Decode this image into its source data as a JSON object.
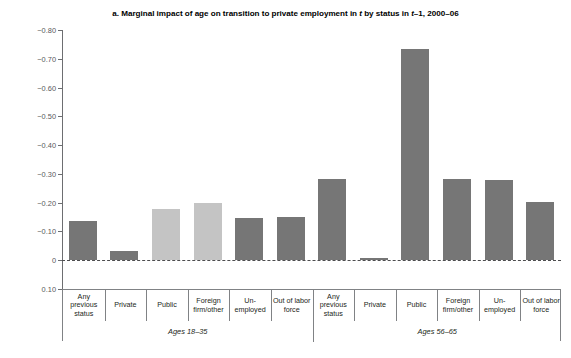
{
  "chart_data": {
    "type": "bar",
    "title": "a. Marginal impact of age on transition to private employment in t by status in t–1, 2000–06",
    "title_parts": {
      "p1": "a. Marginal impact of age on transition to private employment in ",
      "i1": "t",
      "p2": " by status in ",
      "i2": "t",
      "p3": "–1, 2000–06"
    },
    "xlabel": "",
    "ylabel": "Probabilities",
    "ylim": [
      0.1,
      -0.8
    ],
    "y_inverted": true,
    "yticks": [
      "−0.80",
      "−0.70",
      "−0.60",
      "−0.50",
      "−0.40",
      "−0.30",
      "−0.20",
      "−0.10",
      "0",
      "0.10"
    ],
    "ytick_values": [
      -0.8,
      -0.7,
      -0.6,
      -0.5,
      -0.4,
      -0.3,
      -0.2,
      -0.1,
      0,
      0.1
    ],
    "grid": false,
    "legend": "none",
    "zero_line": true,
    "groups": [
      {
        "name": "Ages 18–35",
        "categories": [
          "Any previous status",
          "Private",
          "Public",
          "Foreign firm/other",
          "Un-employed",
          "Out of labor force"
        ],
        "values": [
          -0.135,
          -0.032,
          -0.178,
          -0.2,
          -0.148,
          -0.15
        ],
        "shades": [
          "dark",
          "dark",
          "light",
          "light",
          "dark",
          "dark"
        ]
      },
      {
        "name": "Ages 56–65",
        "categories": [
          "Any previous status",
          "Private",
          "Public",
          "Foreign firm/other",
          "Un-employed",
          "Out of labor force"
        ],
        "values": [
          -0.282,
          -0.008,
          -0.733,
          -0.282,
          -0.278,
          -0.203
        ],
        "shades": [
          "dark",
          "dark",
          "dark",
          "dark",
          "dark",
          "dark"
        ]
      }
    ],
    "colors": {
      "bar_dark": "#767676",
      "bar_light": "#c4c4c4",
      "axis": "#6d6e71",
      "zero_line": "#4d4d4f",
      "text": "#231f20",
      "table_border": "#808285",
      "background": "#ffffff"
    }
  }
}
